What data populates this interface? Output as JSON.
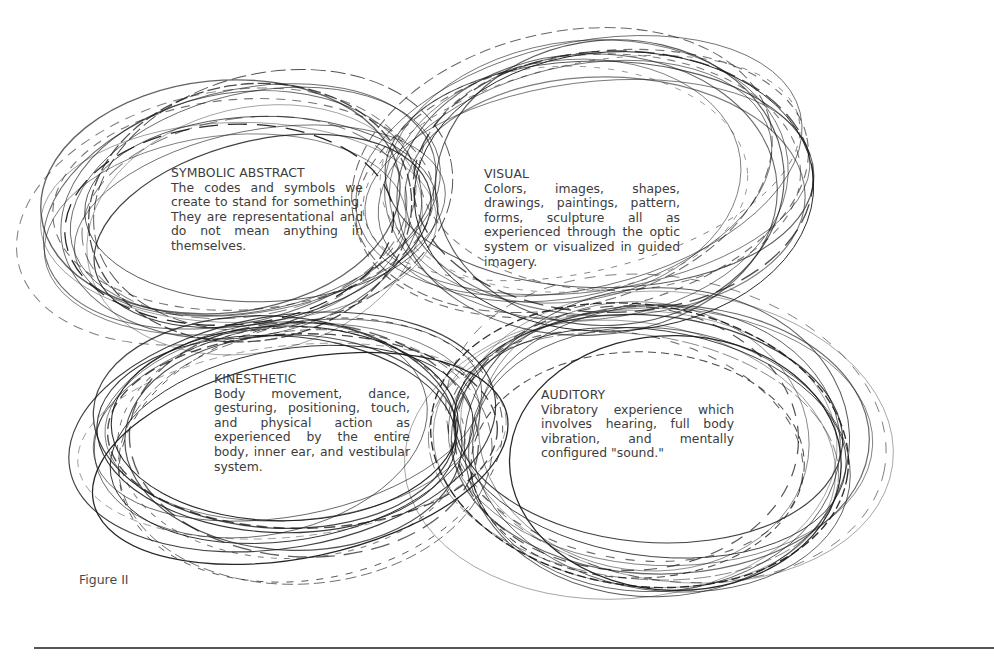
{
  "figure": {
    "caption": "Figure II",
    "stroke_color": "#1a1a1a",
    "rule_color": "#555555"
  },
  "sections": {
    "symbolic": {
      "title": "SYMBOLIC ABSTRACT",
      "body": "The codes and symbols we create to stand for something. They are representational and do not mean anything in themselves."
    },
    "visual": {
      "title": "VISUAL",
      "body": "Colors, images, shapes, drawings, paintings, pattern, forms, sculpture all as experienced through the optic system or visualized in guided imagery."
    },
    "kinesthetic": {
      "title": "KINESTHETIC",
      "body": "Body movement, dance, gesturing, positioning, touch, and physical action as experienced by the entire body, inner ear, and vestibular system."
    },
    "auditory": {
      "title": "AUDITORY",
      "body": "Vibratory experience which involves hearing, full body vibration, and mentally configured \"sound.\""
    }
  },
  "rings": [
    {
      "name": "symbolic-abstract-rings",
      "cx": 245,
      "cy": 215,
      "rx": 185,
      "ry": 112,
      "rot": -8,
      "count": 16
    },
    {
      "name": "visual-rings",
      "cx": 590,
      "cy": 185,
      "rx": 200,
      "ry": 125,
      "rot": -6,
      "count": 16
    },
    {
      "name": "kinesthetic-rings",
      "cx": 290,
      "cy": 440,
      "rx": 190,
      "ry": 115,
      "rot": -4,
      "count": 16
    },
    {
      "name": "auditory-rings",
      "cx": 650,
      "cy": 445,
      "rx": 195,
      "ry": 140,
      "rot": 4,
      "count": 18
    }
  ]
}
